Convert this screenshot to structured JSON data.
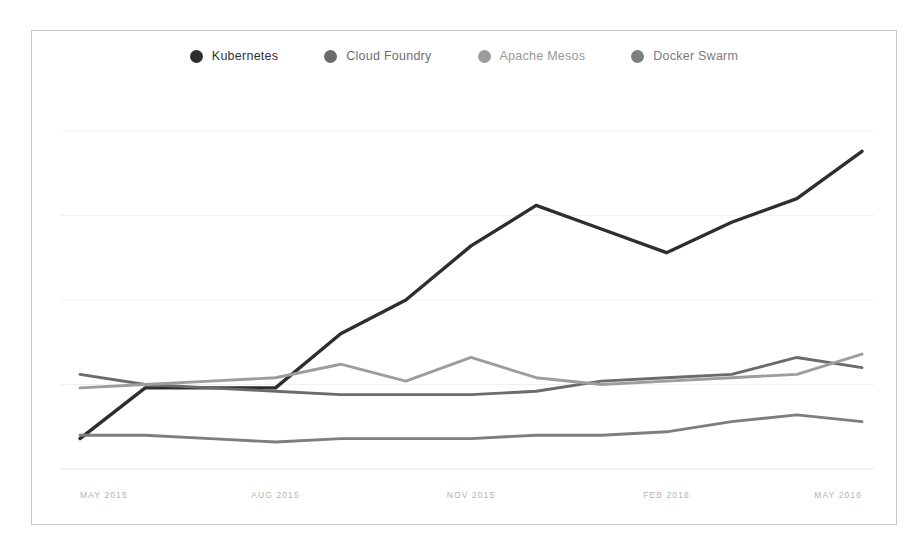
{
  "chart_data": {
    "type": "line",
    "title": "",
    "subtitle": "",
    "xlabel": "",
    "ylabel": "",
    "grid": true,
    "legend_position": "top-center",
    "x_tick_labels": [
      "MAY 2015",
      "AUG 2015",
      "NOV 2015",
      "FEB 2016",
      "MAY 2016"
    ],
    "x_tick_indices": [
      0,
      3,
      6,
      9,
      12
    ],
    "x": [
      "MAY 2015",
      "JUN 2015",
      "JUL 2015",
      "AUG 2015",
      "SEP 2015",
      "OCT 2015",
      "NOV 2015",
      "DEC 2015",
      "JAN 2016",
      "FEB 2016",
      "MAR 2016",
      "APR 2016",
      "MAY 2016"
    ],
    "ylim": [
      0,
      100
    ],
    "y_gridline_values": [
      0,
      25,
      50,
      75,
      100
    ],
    "series": [
      {
        "name": "Kubernetes",
        "color": "#2e2e2e",
        "values": [
          9,
          24,
          24,
          24,
          40,
          50,
          66,
          78,
          71,
          64,
          73,
          80,
          94
        ]
      },
      {
        "name": "Cloud Foundry",
        "color": "#6b6b6b",
        "values": [
          28,
          25,
          24,
          23,
          22,
          22,
          22,
          23,
          26,
          27,
          28,
          33,
          30
        ]
      },
      {
        "name": "Apache Mesos",
        "color": "#9d9d9d",
        "values": [
          24,
          25,
          26,
          27,
          31,
          26,
          33,
          27,
          25,
          26,
          27,
          28,
          34
        ]
      },
      {
        "name": "Docker Swarm",
        "color": "#7e7e7e",
        "values": [
          10,
          10,
          9,
          8,
          9,
          9,
          9,
          10,
          10,
          11,
          14,
          16,
          14
        ]
      }
    ]
  },
  "legend": {
    "items": [
      {
        "label": "Kubernetes",
        "color": "#2e2e2e",
        "text_color": "#333333"
      },
      {
        "label": "Cloud Foundry",
        "color": "#6b6b6b",
        "text_color": "#6e6e6e"
      },
      {
        "label": "Apache Mesos",
        "color": "#9d9d9d",
        "text_color": "#989898"
      },
      {
        "label": "Docker Swarm",
        "color": "#7e7e7e",
        "text_color": "#7b7b7b"
      }
    ]
  }
}
